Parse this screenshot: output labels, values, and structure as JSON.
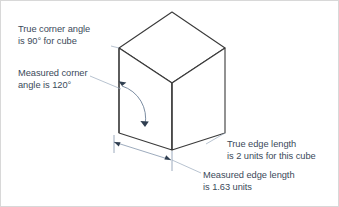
{
  "figure": {
    "background_color": "#ffffff",
    "border_color": "#d8d8d8",
    "text_color": "#3b4a5a",
    "cube_stroke_color": "#3a3a3a",
    "dimension_stroke_color": "#8496ac",
    "arc_stroke_color": "#6c7f96"
  },
  "annotations": {
    "true_corner": {
      "line1": "True corner angle",
      "line2": "is 90° for cube"
    },
    "measured_corner": {
      "line1": "Measured corner",
      "line2": "angle is 120°"
    },
    "true_edge": {
      "line1": "True edge length",
      "line2": "is 2 units for this cube"
    },
    "measured_edge": {
      "line1": "Measured edge length",
      "line2": "is 1.63 units"
    }
  },
  "values": {
    "true_corner_angle_deg": 90,
    "measured_corner_angle_deg": 120,
    "true_edge_length_units": 2,
    "measured_edge_length_units": 1.63
  },
  "cube_geometry": {
    "top_vertex": [
      171,
      11
    ],
    "left_top_vertex": [
      118,
      47
    ],
    "right_top_vertex": [
      224,
      47
    ],
    "center_front_top_vertex": [
      171,
      82
    ],
    "left_bottom_vertex": [
      118,
      132
    ],
    "right_bottom_vertex": [
      224,
      132
    ],
    "center_front_bottom_vertex": [
      171,
      149
    ]
  },
  "dimension_line": {
    "start": [
      113,
      141
    ],
    "end": [
      170,
      159
    ],
    "measures": "measured_edge_length_units"
  }
}
